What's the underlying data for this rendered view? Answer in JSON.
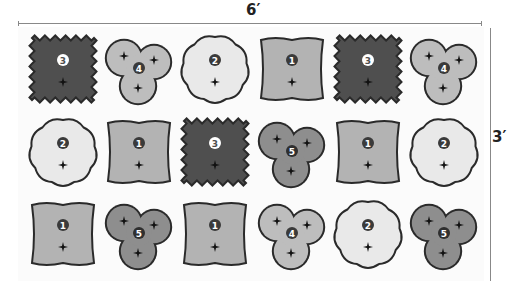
{
  "dimensions": {
    "width_label": "6′",
    "height_label": "3′"
  },
  "legend_types": {
    "1": {
      "shape": "square",
      "fill": "#b3b3b3",
      "badge_fill": "#3a3a3a",
      "badge_text": "#ffffff"
    },
    "2": {
      "shape": "flower",
      "fill": "#e9e9e9",
      "badge_fill": "#3a3a3a",
      "badge_text": "#ffffff"
    },
    "3": {
      "shape": "wavy-square",
      "fill": "#4f4f4f",
      "badge_fill": "#ffffff",
      "badge_text": "#4f4f4f"
    },
    "4": {
      "shape": "trefoil",
      "fill": "#bdbdbd",
      "badge_fill": "#3a3a3a",
      "badge_text": "#ffffff"
    },
    "5": {
      "shape": "scalloped-trefoil",
      "fill": "#8e8e8e",
      "badge_fill": "#2f2f2f",
      "badge_text": "#ffffff"
    }
  },
  "grid": {
    "rows": [
      [
        "3",
        "4",
        "2",
        "1",
        "3",
        "4"
      ],
      [
        "2",
        "1",
        "3",
        "5",
        "1",
        "2"
      ],
      [
        "1",
        "5",
        "1",
        "4",
        "2",
        "5"
      ]
    ]
  },
  "cells": [
    {
      "label": "3"
    },
    {
      "label": "4"
    },
    {
      "label": "2"
    },
    {
      "label": "1"
    },
    {
      "label": "3"
    },
    {
      "label": "4"
    },
    {
      "label": "2"
    },
    {
      "label": "1"
    },
    {
      "label": "3"
    },
    {
      "label": "5"
    },
    {
      "label": "1"
    },
    {
      "label": "2"
    },
    {
      "label": "1"
    },
    {
      "label": "5"
    },
    {
      "label": "1"
    },
    {
      "label": "4"
    },
    {
      "label": "2"
    },
    {
      "label": "5"
    }
  ]
}
